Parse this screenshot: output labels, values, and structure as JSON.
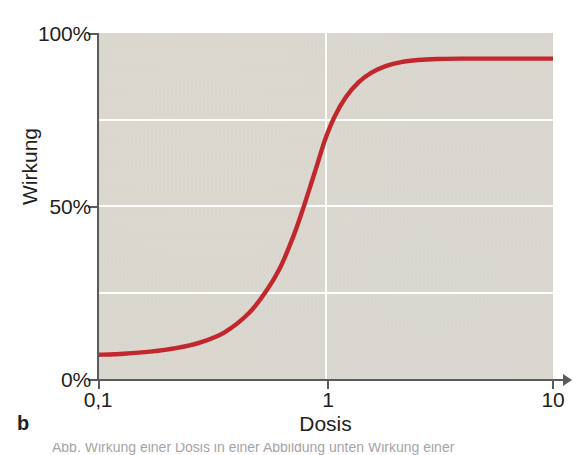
{
  "figure": {
    "panel_label": "b",
    "clipped_caption_fragment": "Abb. Wirkung einer Dosis in einer Abbildung unten Wirkung einer"
  },
  "axes": {
    "y_title": "Wirkung",
    "x_title": "Dosis",
    "y_ticks": [
      {
        "label": "100%",
        "value": 100
      },
      {
        "label": "50%",
        "value": 50
      },
      {
        "label": "0%",
        "value": 0
      }
    ],
    "x_ticks": [
      {
        "label": "0,1",
        "value": 0.1
      },
      {
        "label": "1",
        "value": 1
      },
      {
        "label": "10",
        "value": 10
      }
    ]
  },
  "colors": {
    "curve": "#c1272d",
    "panel_background": "#d7d4cc",
    "gridline": "#fdfdfb",
    "axis": "#5b5b5b",
    "text": "#231f20"
  },
  "chart_data": {
    "type": "line",
    "title": "",
    "subtitle": "",
    "xlabel": "Dosis",
    "ylabel": "Wirkung",
    "xscale": "log",
    "yscale": "linear",
    "xlim": [
      0.1,
      10
    ],
    "ylim": [
      0,
      100
    ],
    "xtick_labels": [
      "0,1",
      "1",
      "10"
    ],
    "xtick_values": [
      0.1,
      1,
      10
    ],
    "ytick_labels": [
      "0%",
      "50%",
      "100%"
    ],
    "ytick_values": [
      0,
      50,
      100
    ],
    "grid": true,
    "gridlines_y": [
      25,
      50,
      75
    ],
    "gridlines_x": [
      1
    ],
    "legend": null,
    "legend_position": "none",
    "annotations": [],
    "series": [
      {
        "name": "Dosis-Wirkungs-Kurve",
        "color": "#c1272d",
        "x": [
          0.1,
          0.13,
          0.17,
          0.22,
          0.28,
          0.36,
          0.46,
          0.55,
          0.63,
          0.72,
          0.79,
          0.87,
          0.93,
          1.0,
          1.1,
          1.23,
          1.4,
          1.6,
          1.85,
          2.15,
          2.55,
          3.1,
          3.9,
          5.0,
          6.5,
          8.0,
          10.0
        ],
        "y": [
          7.0,
          7.3,
          7.9,
          8.9,
          10.5,
          13.5,
          19.0,
          25.5,
          32.0,
          41.0,
          48.5,
          57.0,
          63.0,
          69.5,
          76.0,
          81.5,
          85.8,
          88.6,
          90.5,
          91.6,
          92.2,
          92.5,
          92.6,
          92.6,
          92.6,
          92.6,
          92.6
        ]
      }
    ]
  }
}
